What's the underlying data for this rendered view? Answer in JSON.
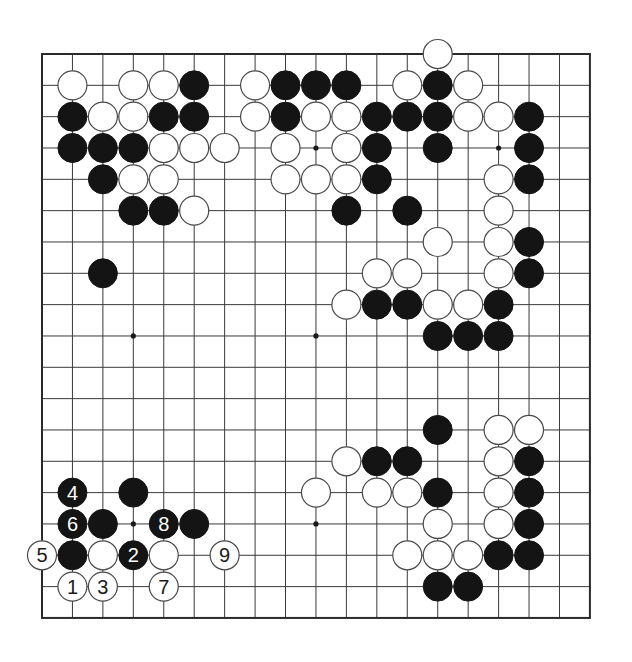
{
  "diagram": {
    "type": "go-board",
    "size": 19,
    "colors": {
      "black_stone": "#141414",
      "white_stone": "#ffffff",
      "line": "#3a3a3a",
      "background": "#ffffff"
    },
    "star_points": [
      [
        3,
        3
      ],
      [
        3,
        9
      ],
      [
        3,
        15
      ],
      [
        9,
        3
      ],
      [
        9,
        9
      ],
      [
        9,
        15
      ],
      [
        15,
        3
      ],
      [
        15,
        9
      ],
      [
        15,
        15
      ]
    ],
    "stones": [
      {
        "row": 0,
        "col": 13,
        "color": "white"
      },
      {
        "row": 1,
        "col": 1,
        "color": "white"
      },
      {
        "row": 1,
        "col": 3,
        "color": "white"
      },
      {
        "row": 1,
        "col": 4,
        "color": "white"
      },
      {
        "row": 1,
        "col": 5,
        "color": "black"
      },
      {
        "row": 1,
        "col": 7,
        "color": "white"
      },
      {
        "row": 1,
        "col": 8,
        "color": "black"
      },
      {
        "row": 1,
        "col": 9,
        "color": "black"
      },
      {
        "row": 1,
        "col": 10,
        "color": "black"
      },
      {
        "row": 1,
        "col": 12,
        "color": "white"
      },
      {
        "row": 1,
        "col": 13,
        "color": "black"
      },
      {
        "row": 1,
        "col": 14,
        "color": "white"
      },
      {
        "row": 2,
        "col": 1,
        "color": "black"
      },
      {
        "row": 2,
        "col": 2,
        "color": "white"
      },
      {
        "row": 2,
        "col": 3,
        "color": "white"
      },
      {
        "row": 2,
        "col": 4,
        "color": "black"
      },
      {
        "row": 2,
        "col": 5,
        "color": "black"
      },
      {
        "row": 2,
        "col": 7,
        "color": "white"
      },
      {
        "row": 2,
        "col": 8,
        "color": "black"
      },
      {
        "row": 2,
        "col": 9,
        "color": "white"
      },
      {
        "row": 2,
        "col": 10,
        "color": "white"
      },
      {
        "row": 2,
        "col": 11,
        "color": "black"
      },
      {
        "row": 2,
        "col": 12,
        "color": "black"
      },
      {
        "row": 2,
        "col": 13,
        "color": "black"
      },
      {
        "row": 2,
        "col": 14,
        "color": "white"
      },
      {
        "row": 2,
        "col": 15,
        "color": "white"
      },
      {
        "row": 2,
        "col": 16,
        "color": "black"
      },
      {
        "row": 3,
        "col": 1,
        "color": "black"
      },
      {
        "row": 3,
        "col": 2,
        "color": "black"
      },
      {
        "row": 3,
        "col": 3,
        "color": "black"
      },
      {
        "row": 3,
        "col": 4,
        "color": "white"
      },
      {
        "row": 3,
        "col": 5,
        "color": "white"
      },
      {
        "row": 3,
        "col": 6,
        "color": "white"
      },
      {
        "row": 3,
        "col": 8,
        "color": "white"
      },
      {
        "row": 3,
        "col": 10,
        "color": "white"
      },
      {
        "row": 3,
        "col": 11,
        "color": "black"
      },
      {
        "row": 3,
        "col": 13,
        "color": "black"
      },
      {
        "row": 3,
        "col": 16,
        "color": "black"
      },
      {
        "row": 4,
        "col": 2,
        "color": "black"
      },
      {
        "row": 4,
        "col": 3,
        "color": "white"
      },
      {
        "row": 4,
        "col": 4,
        "color": "white"
      },
      {
        "row": 4,
        "col": 8,
        "color": "white"
      },
      {
        "row": 4,
        "col": 9,
        "color": "white"
      },
      {
        "row": 4,
        "col": 10,
        "color": "white"
      },
      {
        "row": 4,
        "col": 11,
        "color": "black"
      },
      {
        "row": 4,
        "col": 15,
        "color": "white"
      },
      {
        "row": 4,
        "col": 16,
        "color": "black"
      },
      {
        "row": 5,
        "col": 3,
        "color": "black"
      },
      {
        "row": 5,
        "col": 4,
        "color": "black"
      },
      {
        "row": 5,
        "col": 5,
        "color": "white"
      },
      {
        "row": 5,
        "col": 10,
        "color": "black"
      },
      {
        "row": 5,
        "col": 12,
        "color": "black"
      },
      {
        "row": 5,
        "col": 15,
        "color": "white"
      },
      {
        "row": 6,
        "col": 13,
        "color": "white"
      },
      {
        "row": 6,
        "col": 15,
        "color": "white"
      },
      {
        "row": 6,
        "col": 16,
        "color": "black"
      },
      {
        "row": 7,
        "col": 2,
        "color": "black"
      },
      {
        "row": 7,
        "col": 11,
        "color": "white"
      },
      {
        "row": 7,
        "col": 12,
        "color": "white"
      },
      {
        "row": 7,
        "col": 15,
        "color": "white"
      },
      {
        "row": 7,
        "col": 16,
        "color": "black"
      },
      {
        "row": 8,
        "col": 10,
        "color": "white"
      },
      {
        "row": 8,
        "col": 11,
        "color": "black"
      },
      {
        "row": 8,
        "col": 12,
        "color": "black"
      },
      {
        "row": 8,
        "col": 13,
        "color": "white"
      },
      {
        "row": 8,
        "col": 14,
        "color": "white"
      },
      {
        "row": 8,
        "col": 15,
        "color": "black"
      },
      {
        "row": 9,
        "col": 13,
        "color": "black"
      },
      {
        "row": 9,
        "col": 14,
        "color": "black"
      },
      {
        "row": 9,
        "col": 15,
        "color": "black"
      },
      {
        "row": 12,
        "col": 13,
        "color": "black"
      },
      {
        "row": 12,
        "col": 15,
        "color": "white"
      },
      {
        "row": 12,
        "col": 16,
        "color": "white"
      },
      {
        "row": 13,
        "col": 10,
        "color": "white"
      },
      {
        "row": 13,
        "col": 11,
        "color": "black"
      },
      {
        "row": 13,
        "col": 12,
        "color": "black"
      },
      {
        "row": 13,
        "col": 15,
        "color": "white"
      },
      {
        "row": 13,
        "col": 16,
        "color": "black"
      },
      {
        "row": 14,
        "col": 1,
        "color": "black",
        "label": "4"
      },
      {
        "row": 14,
        "col": 3,
        "color": "black"
      },
      {
        "row": 14,
        "col": 9,
        "color": "white"
      },
      {
        "row": 14,
        "col": 11,
        "color": "white"
      },
      {
        "row": 14,
        "col": 12,
        "color": "white"
      },
      {
        "row": 14,
        "col": 13,
        "color": "black"
      },
      {
        "row": 14,
        "col": 15,
        "color": "white"
      },
      {
        "row": 14,
        "col": 16,
        "color": "black"
      },
      {
        "row": 15,
        "col": 1,
        "color": "black",
        "label": "6"
      },
      {
        "row": 15,
        "col": 2,
        "color": "black"
      },
      {
        "row": 15,
        "col": 4,
        "color": "black",
        "label": "8"
      },
      {
        "row": 15,
        "col": 5,
        "color": "black"
      },
      {
        "row": 15,
        "col": 13,
        "color": "white"
      },
      {
        "row": 15,
        "col": 15,
        "color": "white"
      },
      {
        "row": 15,
        "col": 16,
        "color": "black"
      },
      {
        "row": 16,
        "col": 0,
        "color": "white",
        "label": "5"
      },
      {
        "row": 16,
        "col": 1,
        "color": "black"
      },
      {
        "row": 16,
        "col": 2,
        "color": "white"
      },
      {
        "row": 16,
        "col": 3,
        "color": "black",
        "label": "2"
      },
      {
        "row": 16,
        "col": 4,
        "color": "white"
      },
      {
        "row": 16,
        "col": 6,
        "color": "white",
        "label": "9"
      },
      {
        "row": 16,
        "col": 12,
        "color": "white"
      },
      {
        "row": 16,
        "col": 13,
        "color": "white"
      },
      {
        "row": 16,
        "col": 14,
        "color": "white"
      },
      {
        "row": 16,
        "col": 15,
        "color": "black"
      },
      {
        "row": 16,
        "col": 16,
        "color": "black"
      },
      {
        "row": 17,
        "col": 1,
        "color": "white",
        "label": "1"
      },
      {
        "row": 17,
        "col": 2,
        "color": "white",
        "label": "3"
      },
      {
        "row": 17,
        "col": 4,
        "color": "white",
        "label": "7"
      },
      {
        "row": 17,
        "col": 13,
        "color": "black"
      },
      {
        "row": 17,
        "col": 14,
        "color": "black"
      }
    ]
  }
}
